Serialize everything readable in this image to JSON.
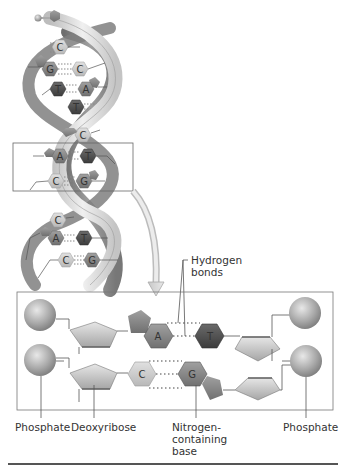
{
  "figure": {
    "type": "DNA double helix diagram",
    "helix": {
      "base_pairs": [
        {
          "left": "",
          "right": "C"
        },
        {
          "left": "G",
          "right": "C"
        },
        {
          "left": "T",
          "right": "A"
        },
        {
          "left": "T",
          "right": ""
        },
        {
          "left": "",
          "right": "C"
        },
        {
          "left": "A",
          "right": "T"
        },
        {
          "left": "C",
          "right": "G"
        },
        {
          "left": "C",
          "right": ""
        },
        {
          "left": "A",
          "right": "T"
        },
        {
          "left": "C",
          "right": "G"
        }
      ]
    },
    "detail": {
      "top_pair": {
        "left": "A",
        "right": "T"
      },
      "bottom_pair": {
        "left": "C",
        "right": "G"
      }
    },
    "labels": {
      "hydrogen_bonds": [
        "Hydrogen",
        "bonds"
      ],
      "phosphate_left": "Phosphate",
      "deoxyribose": "Deoxyribose",
      "nitrogen_base": [
        "Nitrogen-",
        "containing",
        "base"
      ],
      "phosphate_right": "Phosphate"
    },
    "colors": {
      "backbone_light": "#d9d9d9",
      "backbone_dark": "#8a8a8a",
      "base_dark": "#555555",
      "base_mid": "#888888",
      "base_light": "#c8c8c8",
      "box_border": "#777777"
    }
  }
}
